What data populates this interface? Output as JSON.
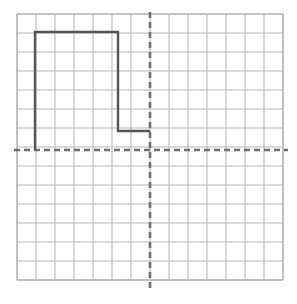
{
  "figure": {
    "name": "coordinate-grid-step-function",
    "background_color": "#ffffff",
    "width": 297,
    "height": 304
  },
  "grid": {
    "label": "graph paper grid",
    "x_left_px": 17,
    "y_top_px": 14,
    "cell_size_px": 19,
    "columns": 14,
    "rows": 14,
    "line_color": "#b8b8b8",
    "line_width": 1.1,
    "outer_border_color": "#b0b0b0"
  },
  "axes": {
    "label": "dashed coordinate axes",
    "color": "#6e6e6e",
    "line_width": 2.6,
    "dash_pattern": "6 4",
    "x_axis": {
      "name": "horizontal-axis",
      "y_px": 150,
      "x_start_px": 14,
      "x_end_px": 288,
      "grid_row_index": 7
    },
    "y_axis": {
      "name": "vertical-axis",
      "x_px": 150,
      "y_start_px": 12,
      "y_end_px": 291,
      "grid_col_index": 7
    }
  },
  "chart_data": {
    "type": "line",
    "title": "",
    "xlabel": "",
    "ylabel": "",
    "grid": true,
    "legend": false,
    "xlim": [
      -7,
      7
    ],
    "ylim": [
      -7,
      7
    ],
    "x_tick_step": 1,
    "y_tick_step": 1,
    "series": [
      {
        "name": "step-function-curve",
        "color": "#555555",
        "line_width": 2.4,
        "line_style": "solid",
        "closed": false,
        "points_grid": [
          [
            -6,
            0
          ],
          [
            -6,
            6
          ],
          [
            -1.7,
            6
          ],
          [
            -1.7,
            1
          ],
          [
            0,
            1
          ]
        ],
        "points_px": [
          [
            35,
            150
          ],
          [
            35,
            32
          ],
          [
            118,
            32
          ],
          [
            118,
            131
          ],
          [
            150,
            131
          ]
        ]
      }
    ],
    "annotations": []
  }
}
